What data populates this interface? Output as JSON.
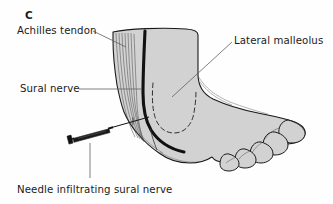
{
  "figure": {
    "panel_letter": "C",
    "background_color": "#fefefe",
    "skin_fill_color": "#d2d2d2",
    "outline_color": "#1a1a1a",
    "nerve_color": "#111111",
    "leader_line_color": "#555555",
    "dashed_outline_color": "#333333",
    "title_region": "lateral ankle and foot, sural nerve block"
  },
  "labels": {
    "achilles_tendon": "Achilles tendon",
    "lateral_malleolus": "Lateral malleolus",
    "sural_nerve": "Sural nerve",
    "needle": "Needle infiltrating sural nerve"
  },
  "anatomy": {
    "structures": [
      "Achilles tendon",
      "Lateral malleolus",
      "Sural nerve",
      "Foot",
      "Toes"
    ],
    "instrument": "syringe with needle",
    "needle_target": "sural nerve"
  }
}
